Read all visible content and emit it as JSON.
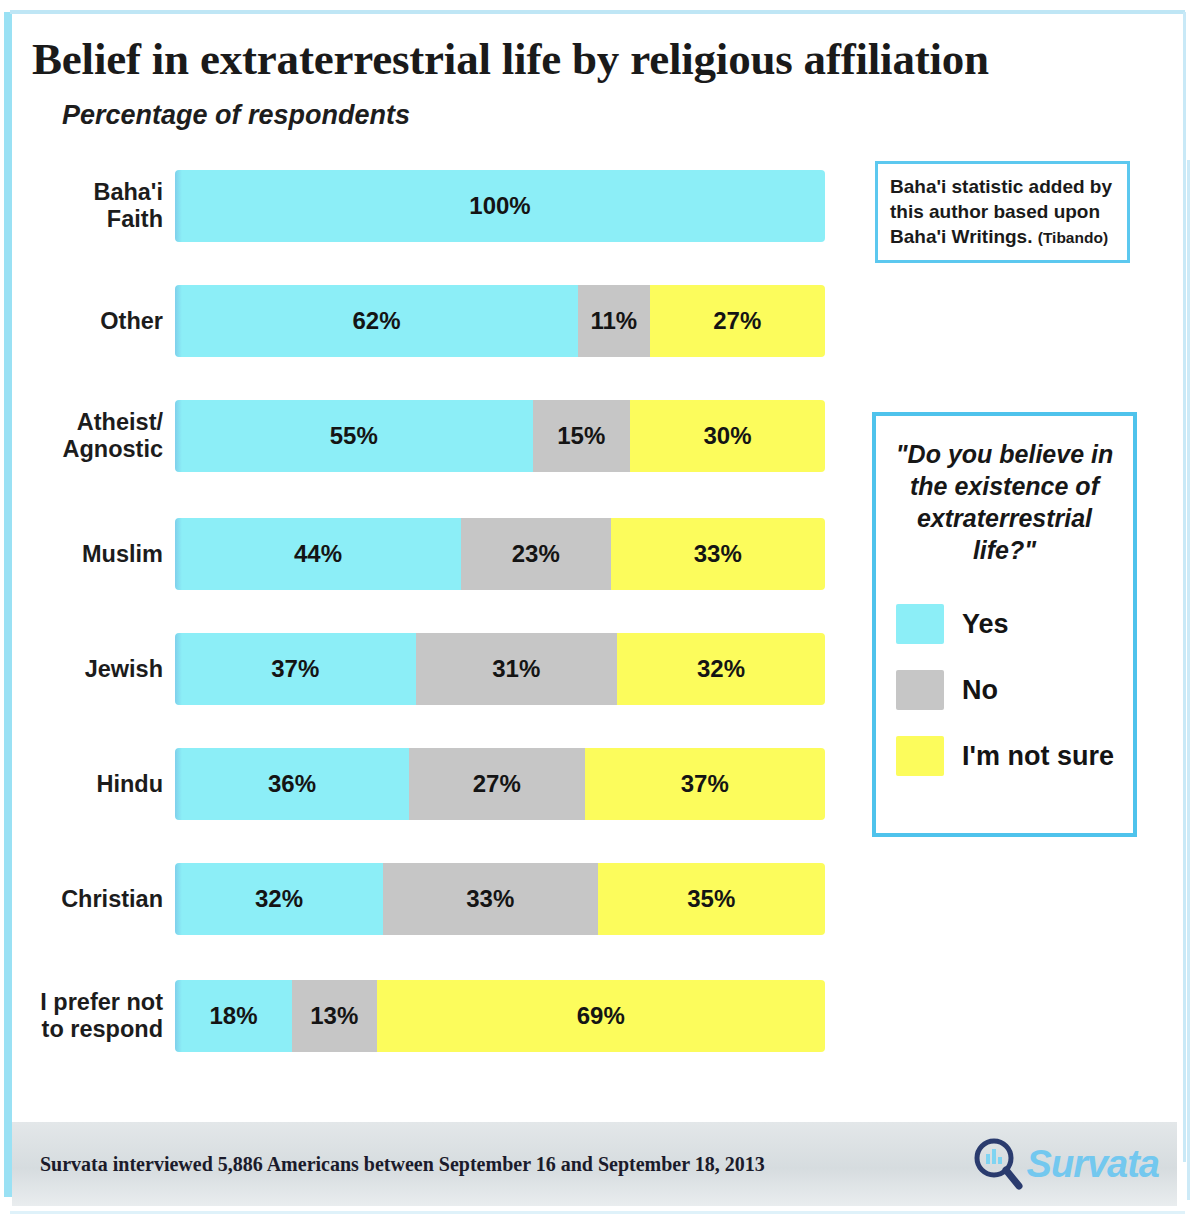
{
  "title": "Belief in extraterrestrial life by religious affiliation",
  "subtitle": "Percentage of respondents",
  "note": {
    "line1": "Baha'i statistic added by this author based upon Baha'i Writings.",
    "attribution": "(Tibando)"
  },
  "legend": {
    "question": "\"Do you believe in the existence of extraterrestrial life?\"",
    "items": [
      {
        "label": "Yes",
        "color": "#8ceef7"
      },
      {
        "label": "No",
        "color": "#c6c6c6"
      },
      {
        "label": "I'm not sure",
        "color": "#fcfc5c"
      }
    ]
  },
  "footer": {
    "text": "Survata interviewed 5,886 Americans between  September  16 and September  18,  2013",
    "logo_text": "Survata",
    "logo_icon": "magnifying-glass-icon"
  },
  "chart_data": {
    "type": "bar",
    "subtype": "stacked-horizontal-100",
    "title": "Belief in extraterrestrial life by religious affiliation",
    "subtitle": "Percentage of respondents",
    "xlabel": "",
    "ylabel": "",
    "xlim": [
      0,
      100
    ],
    "grid": false,
    "legend_position": "right",
    "categories": [
      "Baha'i Faith",
      "Other",
      "Atheist/ Agnostic",
      "Muslim",
      "Jewish",
      "Hindu",
      "Christian",
      "I prefer not to respond"
    ],
    "series": [
      {
        "name": "Yes",
        "color": "#8ceef7",
        "values": [
          100,
          62,
          55,
          44,
          37,
          36,
          32,
          18
        ]
      },
      {
        "name": "No",
        "color": "#c6c6c6",
        "values": [
          0,
          11,
          15,
          23,
          31,
          27,
          33,
          13
        ]
      },
      {
        "name": "I'm not sure",
        "color": "#fcfc5c",
        "values": [
          0,
          27,
          30,
          33,
          32,
          37,
          35,
          69
        ]
      }
    ],
    "rows": [
      {
        "label": "Baha'i\nFaith",
        "yes": 100,
        "no": 0,
        "unsure": 0,
        "yes_text": "100%",
        "no_text": "",
        "unsure_text": ""
      },
      {
        "label": "Other",
        "yes": 62,
        "no": 11,
        "unsure": 27,
        "yes_text": "62%",
        "no_text": "11%",
        "unsure_text": "27%"
      },
      {
        "label": "Atheist/\nAgnostic",
        "yes": 55,
        "no": 15,
        "unsure": 30,
        "yes_text": "55%",
        "no_text": "15%",
        "unsure_text": "30%"
      },
      {
        "label": "Muslim",
        "yes": 44,
        "no": 23,
        "unsure": 33,
        "yes_text": "44%",
        "no_text": "23%",
        "unsure_text": "33%"
      },
      {
        "label": "Jewish",
        "yes": 37,
        "no": 31,
        "unsure": 32,
        "yes_text": "37%",
        "no_text": "31%",
        "unsure_text": "32%"
      },
      {
        "label": "Hindu",
        "yes": 36,
        "no": 27,
        "unsure": 37,
        "yes_text": "36%",
        "no_text": "27%",
        "unsure_text": "37%"
      },
      {
        "label": "Christian",
        "yes": 32,
        "no": 33,
        "unsure": 35,
        "yes_text": "32%",
        "no_text": "33%",
        "unsure_text": "35%"
      },
      {
        "label": "I prefer not\nto respond",
        "yes": 18,
        "no": 13,
        "unsure": 69,
        "yes_text": "18%",
        "no_text": "13%",
        "unsure_text": "69%"
      }
    ]
  }
}
